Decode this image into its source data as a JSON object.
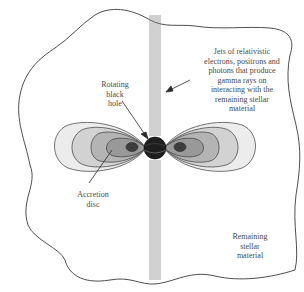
{
  "diagram": {
    "labels": {
      "jets": "Jets of relativistic\nelectrons, positrons and\nphotons that produce\ngamma rays on\ninteracting with the\nremaining stellar\nmaterial",
      "black_hole": "Rotating\nblack\nhole",
      "accretion_disc": "Accretion\ndisc",
      "stellar_material": "Remaining\nstellar\nmaterial"
    },
    "colors": {
      "outline": "#3a3a3a",
      "disc_outer": "#ececec",
      "disc_ring2": "#d2d2d2",
      "disc_ring3": "#b4b4b4",
      "disc_inner": "#999999",
      "disc_core": "#3c3c3c",
      "black_hole": "#1e1e1e",
      "jet_lines": "#8a8a8a",
      "text": "#4a4a4a"
    }
  }
}
